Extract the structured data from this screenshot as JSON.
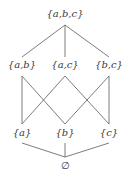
{
  "diagram": {
    "type": "hasse-diagram",
    "nodes": [
      {
        "id": "abc",
        "label": "{a,b,c}",
        "level": 3
      },
      {
        "id": "ab",
        "label": "{a,b}",
        "level": 2
      },
      {
        "id": "ac",
        "label": "{a,c}",
        "level": 2
      },
      {
        "id": "bc",
        "label": "{b,c}",
        "level": 2
      },
      {
        "id": "a",
        "label": "{a}",
        "level": 1
      },
      {
        "id": "b",
        "label": "{b}",
        "level": 1
      },
      {
        "id": "c",
        "label": "{c}",
        "level": 1
      },
      {
        "id": "empty",
        "label": "∅",
        "level": 0
      }
    ],
    "edges": [
      [
        "abc",
        "ab"
      ],
      [
        "abc",
        "ac"
      ],
      [
        "abc",
        "bc"
      ],
      [
        "ab",
        "a"
      ],
      [
        "ab",
        "b"
      ],
      [
        "ac",
        "a"
      ],
      [
        "ac",
        "c"
      ],
      [
        "bc",
        "b"
      ],
      [
        "bc",
        "c"
      ],
      [
        "a",
        "empty"
      ],
      [
        "b",
        "empty"
      ],
      [
        "c",
        "empty"
      ]
    ]
  }
}
